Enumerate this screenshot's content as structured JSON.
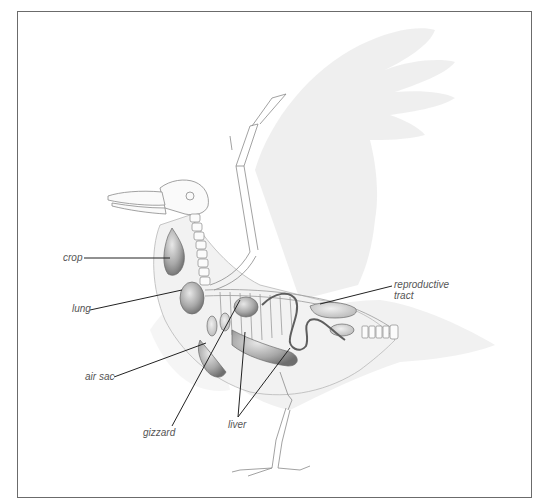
{
  "figure": {
    "colors": {
      "frame": "#6b6b6b",
      "leader_line": "#222222",
      "label_text": "#555555",
      "wing_shadow": "#e4e4e4",
      "organ_fill": "#9a9a9a",
      "bone_stroke": "#8a8a8a"
    }
  },
  "labels": {
    "crop": "crop",
    "lung": "lung",
    "air_sac": "air sac",
    "gizzard": "gizzard",
    "liver": "liver",
    "reproductive_tract_line1": "reproductive",
    "reproductive_tract_line2": "tract"
  }
}
